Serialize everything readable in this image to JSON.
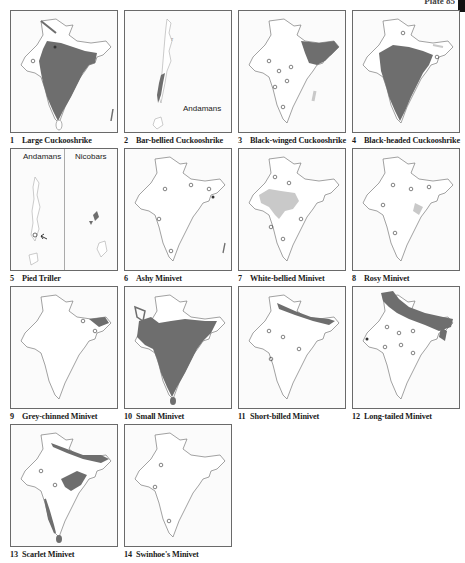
{
  "plate": {
    "label": "Plate 85"
  },
  "legend": {
    "range_fill": "#6e6e6e",
    "pale_fill": "#c9c9c9",
    "outline_color": "#7a7a7a",
    "record_marker": "open-circle"
  },
  "panels": [
    {
      "number": "1",
      "species": "Large Cuckooshrike",
      "map": "india",
      "range": "peninsula-wide"
    },
    {
      "number": "2",
      "species": "Bar-bellied Cuckooshrike",
      "map": "andamans",
      "map_label": "Andamans",
      "range": "south-andaman"
    },
    {
      "number": "3",
      "species": "Black-winged Cuckooshrike",
      "map": "india",
      "range": "northeast-himalaya"
    },
    {
      "number": "4",
      "species": "Black-headed Cuckooshrike",
      "map": "india",
      "range": "central-peninsula"
    },
    {
      "number": "5",
      "species": "Pied Triller",
      "map": "andamans-nicobars",
      "map_labels": [
        "Andamans",
        "Nicobars"
      ],
      "range": "nicobar-islands"
    },
    {
      "number": "6",
      "species": "Ashy Minivet",
      "map": "india",
      "range": "scattered-records"
    },
    {
      "number": "7",
      "species": "White-bellied Minivet",
      "map": "india",
      "range": "northwest-central"
    },
    {
      "number": "8",
      "species": "Rosy Minivet",
      "map": "india",
      "range": "scattered-records"
    },
    {
      "number": "9",
      "species": "Grey-chinned Minivet",
      "map": "india",
      "range": "northeast"
    },
    {
      "number": "10",
      "species": "Small Minivet",
      "map": "india",
      "range": "peninsula-wide"
    },
    {
      "number": "11",
      "species": "Short-billed Minivet",
      "map": "india",
      "range": "himalaya-northeast"
    },
    {
      "number": "12",
      "species": "Long-tailed Minivet",
      "map": "india",
      "range": "himalaya-band"
    },
    {
      "number": "13",
      "species": "Scarlet Minivet",
      "map": "india",
      "range": "himalaya-east-westghats"
    },
    {
      "number": "14",
      "species": "Swinhoe's Minivet",
      "map": "india",
      "range": "scattered-records"
    }
  ]
}
